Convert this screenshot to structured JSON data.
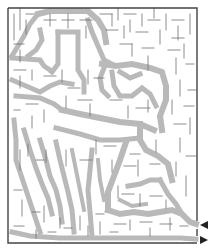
{
  "puzzle": {
    "type": "maze",
    "hidden_picture": "dog",
    "shade_color": "#b9b9b9",
    "wall_color": "#6e6e6e",
    "border_color": "#444444",
    "entrance": {
      "label": "entrance-arrow",
      "direction": "left",
      "x": 203,
      "y": 225
    },
    "exit": {
      "label": "exit-arrow",
      "direction": "right",
      "x": 203,
      "y": 240
    }
  }
}
